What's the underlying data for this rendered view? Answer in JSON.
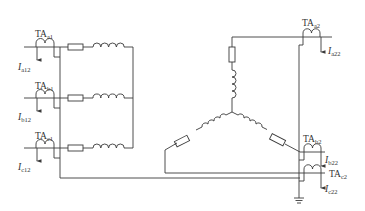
{
  "diagram": {
    "type": "circuit",
    "line_color": "#3a3a3a",
    "left_group": {
      "ct_labels": [
        {
          "main": "TA",
          "sub": "a1"
        },
        {
          "main": "TA",
          "sub": "b1"
        },
        {
          "main": "TA",
          "sub": "c1"
        }
      ],
      "current_labels": [
        {
          "main": "I",
          "sub": "a12"
        },
        {
          "main": "I",
          "sub": "b12"
        },
        {
          "main": "I",
          "sub": "c12"
        }
      ]
    },
    "right_group": {
      "ct_labels": [
        {
          "main": "TA",
          "sub": "a2"
        },
        {
          "main": "TA",
          "sub": "b2"
        },
        {
          "main": "TA",
          "sub": "c2"
        }
      ],
      "current_labels": [
        {
          "main": "I",
          "sub": "a22"
        },
        {
          "main": "I",
          "sub": "b22"
        },
        {
          "main": "I",
          "sub": "c22"
        }
      ]
    },
    "components": [
      "resistor",
      "inductor",
      "current-transformer",
      "ground",
      "star-connected-load"
    ]
  }
}
